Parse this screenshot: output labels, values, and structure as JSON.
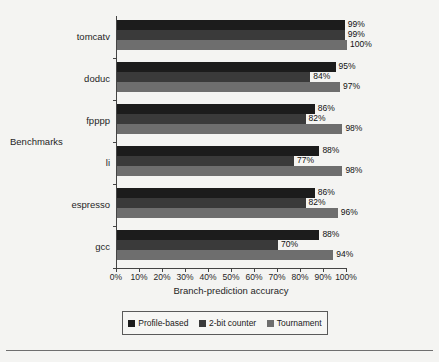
{
  "chart_data": {
    "type": "bar",
    "orientation": "horizontal",
    "title": "",
    "xlabel": "Branch-prediction accuracy",
    "ylabel": "Benchmarks",
    "xlim": [
      0,
      100
    ],
    "xticks": [
      "0%",
      "10%",
      "20%",
      "30%",
      "40%",
      "50%",
      "60%",
      "70%",
      "80%",
      "90%",
      "100%"
    ],
    "grid": false,
    "legend_position": "bottom",
    "categories": [
      "tomcatv",
      "doduc",
      "fpppp",
      "li",
      "espresso",
      "gcc"
    ],
    "series": [
      {
        "name": "Profile-based",
        "color": "#1c1c1c",
        "values": [
          99,
          95,
          86,
          88,
          86,
          88
        ],
        "labels": [
          "99%",
          "95%",
          "86%",
          "88%",
          "86%",
          "88%"
        ]
      },
      {
        "name": "2-bit counter",
        "color": "#3a3a3a",
        "values": [
          99,
          84,
          82,
          77,
          82,
          70
        ],
        "labels": [
          "99%",
          "84%",
          "82%",
          "77%",
          "82%",
          "70%"
        ]
      },
      {
        "name": "Tournament",
        "color": "#6e6e6e",
        "values": [
          100,
          97,
          98,
          98,
          96,
          94
        ],
        "labels": [
          "100%",
          "97%",
          "98%",
          "98%",
          "96%",
          "94%"
        ]
      }
    ]
  },
  "axes": {
    "y_title": "Benchmarks",
    "x_title": "Branch-prediction accuracy"
  },
  "legend": {
    "items": [
      {
        "label": "Profile-based",
        "color": "#1c1c1c"
      },
      {
        "label": "2-bit counter",
        "color": "#3a3a3a"
      },
      {
        "label": "Tournament",
        "color": "#6e6e6e"
      }
    ]
  }
}
